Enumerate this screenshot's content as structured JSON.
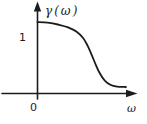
{
  "chart_data": {
    "type": "line",
    "title": "γ(ω)",
    "ylabel": "γ(ω)",
    "xlabel": "ω",
    "x_tick_label": "0",
    "y_tick_label": "1",
    "xlim": [
      0,
      1.45
    ],
    "ylim": [
      0,
      1.25
    ],
    "grid": false,
    "legend": "none",
    "ink_color": "#1c1c1c",
    "background_color": "#ffffff",
    "series": [
      {
        "name": "γ(ω)",
        "points": [
          [
            0.0,
            1.0
          ],
          [
            0.15,
            0.99
          ],
          [
            0.3,
            0.965
          ],
          [
            0.45,
            0.925
          ],
          [
            0.57,
            0.865
          ],
          [
            0.67,
            0.775
          ],
          [
            0.74,
            0.66
          ],
          [
            0.8,
            0.53
          ],
          [
            0.86,
            0.39
          ],
          [
            0.92,
            0.27
          ],
          [
            0.99,
            0.175
          ],
          [
            1.07,
            0.115
          ],
          [
            1.17,
            0.09
          ],
          [
            1.3,
            0.085
          ]
        ]
      }
    ]
  }
}
